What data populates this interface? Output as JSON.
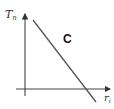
{
  "diagram": {
    "y_axis": {
      "label": "T",
      "subscript": "n"
    },
    "x_axis": {
      "label": "r",
      "subscript": "i"
    },
    "region_label": "C",
    "line": {
      "description": "straight line with negative slope crossing the x-axis",
      "color": "#555555"
    },
    "colors": {
      "axes": "#444444",
      "line": "#555555",
      "text": "#222222"
    }
  }
}
